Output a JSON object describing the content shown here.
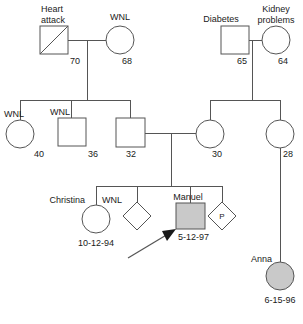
{
  "chart": {
    "type": "pedigree",
    "title": "",
    "generations": 3
  },
  "generation1": {
    "left_couple": {
      "father": {
        "id": "g1-father",
        "shape": "square",
        "sex": "male",
        "deceased": true,
        "affected": false,
        "condition_label": "Heart",
        "condition_label_line2": "attack",
        "age": "70"
      },
      "mother": {
        "id": "g1-mother",
        "shape": "circle",
        "sex": "female",
        "deceased": false,
        "affected": false,
        "condition_label": "WNL",
        "age": "68"
      }
    },
    "right_couple": {
      "father": {
        "id": "g1-father-right",
        "shape": "square",
        "sex": "male",
        "deceased": false,
        "affected": false,
        "condition_label": "Diabetes",
        "age": "65"
      },
      "mother": {
        "id": "g1-mother-right",
        "shape": "circle",
        "sex": "female",
        "deceased": false,
        "affected": false,
        "condition_label": "Kidney",
        "condition_label_line2": "problems",
        "age": "64"
      }
    }
  },
  "generation2": {
    "left_siblings": [
      {
        "id": "g2-sister-40",
        "shape": "circle",
        "sex": "female",
        "condition_label": "WNL",
        "age": "40"
      },
      {
        "id": "g2-brother-36",
        "shape": "square",
        "sex": "male",
        "condition_label": "WNL",
        "age": "36"
      },
      {
        "id": "g2-father-32",
        "shape": "square",
        "sex": "male",
        "condition_label": "",
        "age": "32"
      }
    ],
    "right_siblings": [
      {
        "id": "g2-mother-30",
        "shape": "circle",
        "sex": "female",
        "condition_label": "",
        "age": "30"
      },
      {
        "id": "g2-aunt-28",
        "shape": "circle",
        "sex": "female",
        "condition_label": "",
        "age": "28"
      }
    ]
  },
  "generation3": {
    "children": [
      {
        "id": "g3-christina",
        "shape": "circle",
        "sex": "female",
        "name": "Christina",
        "condition_label": "WNL",
        "birthdate": "10-12-94",
        "affected": false
      },
      {
        "id": "g3-unknown-1",
        "shape": "diamond",
        "sex": "unknown",
        "name": "",
        "condition_label": "",
        "birthdate": "",
        "affected": false
      },
      {
        "id": "g3-manuel",
        "shape": "square",
        "sex": "male",
        "name": "Manuel",
        "condition_label": "",
        "birthdate": "5-12-97",
        "affected": true,
        "proband": true
      },
      {
        "id": "g3-pregnancy",
        "shape": "diamond",
        "sex": "unknown",
        "name": "",
        "condition_label": "P",
        "birthdate": "",
        "affected": false
      }
    ],
    "cousin": {
      "id": "g3-anna",
      "shape": "circle",
      "sex": "female",
      "name": "Anna",
      "condition_label": "",
      "birthdate": "6-15-96",
      "affected": true
    }
  },
  "legend": {
    "affected_fill": "#c9c9c9",
    "unaffected_fill": "#ffffff",
    "stroke": "#555555"
  }
}
